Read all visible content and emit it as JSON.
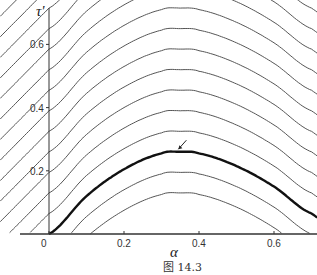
{
  "chart_data": {
    "type": "line",
    "title": "",
    "caption": "图 14.3",
    "xlabel": "α",
    "ylabel": "τ'",
    "xlim": [
      -0.13,
      0.71
    ],
    "ylim": [
      0,
      0.74
    ],
    "grid": false,
    "legend": null,
    "x_ticks": [
      {
        "value": 0,
        "label": "0"
      },
      {
        "value": 0.2,
        "label": "0.2"
      },
      {
        "value": 0.4,
        "label": "0.4"
      },
      {
        "value": 0.6,
        "label": "0.6"
      }
    ],
    "y_ticks": [
      {
        "value": 0.2,
        "label": "0.2"
      },
      {
        "value": 0.4,
        "label": "0.4"
      },
      {
        "value": 0.6,
        "label": "0.6"
      }
    ],
    "curve_family": {
      "description": "Family of level curves τ' = f(α) + c; highlighted curve passes through origin",
      "offsets": [
        -0.13,
        -0.065,
        0,
        0.065,
        0.13,
        0.195,
        0.26,
        0.325,
        0.39,
        0.455,
        0.52,
        0.585,
        0.65,
        0.715,
        0.78,
        0.845,
        0.91,
        0.975,
        1.04
      ],
      "highlighted_offset": 0,
      "highlighted_points": [
        {
          "alpha": 0.0,
          "tau": 0.0
        },
        {
          "alpha": 0.1,
          "tau": 0.12
        },
        {
          "alpha": 0.2,
          "tau": 0.205
        },
        {
          "alpha": 0.3,
          "tau": 0.255
        },
        {
          "alpha": 0.35,
          "tau": 0.26
        },
        {
          "alpha": 0.4,
          "tau": 0.255
        },
        {
          "alpha": 0.5,
          "tau": 0.215
        },
        {
          "alpha": 0.6,
          "tau": 0.15
        },
        {
          "alpha": 0.7,
          "tau": 0.065
        }
      ]
    },
    "annotations": [
      {
        "type": "arrow",
        "target": {
          "alpha": 0.345,
          "tau": 0.262
        },
        "note": "points to maximum of highlighted curve"
      }
    ]
  },
  "colors": {
    "curve": "#555555",
    "highlight": "#111111",
    "axis": "#333333",
    "background": "#ffffff"
  }
}
